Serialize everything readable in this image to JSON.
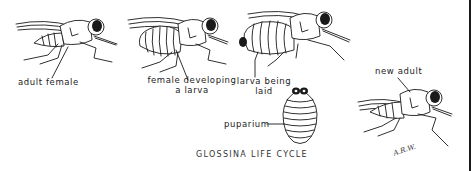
{
  "figure": {
    "title": "GLOSSINA LIFE CYCLE",
    "signature": "A.R.W.",
    "stages": [
      {
        "id": "adult-female",
        "label": "adult female"
      },
      {
        "id": "female-developing-larva",
        "label_line1": "female developing",
        "label_line2": "a larva"
      },
      {
        "id": "larva-being-laid",
        "label_line1": "larva being",
        "label_line2": "laid"
      },
      {
        "id": "puparium",
        "label": "puparium"
      },
      {
        "id": "new-adult",
        "label": "new adult"
      }
    ]
  },
  "colors": {
    "ink": "#1a1a1a",
    "background": "#ffffff"
  }
}
